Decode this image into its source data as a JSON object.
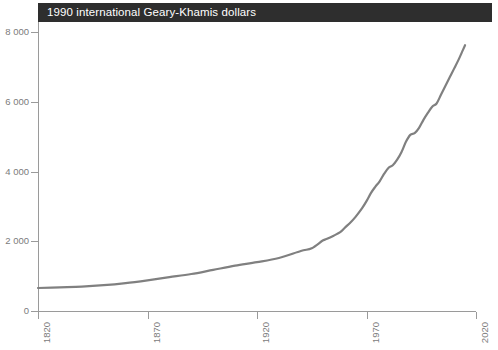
{
  "banner": {
    "title": "1990 international Geary-Khamis dollars"
  },
  "top_caption": {
    "text": ""
  },
  "colors": {
    "banner_background": "#2e2e2e",
    "banner_text": "#ffffff",
    "series_line": "#808080",
    "axis": "#9a9a9a",
    "tick_label": "#7b7b7b",
    "plot_background": "#ffffff"
  },
  "axes": {
    "y_ticks": [
      "0",
      "2 000",
      "4 000",
      "6 000",
      "8 000"
    ],
    "x_ticks": [
      "1820",
      "1870",
      "1920",
      "1970",
      "2020"
    ]
  },
  "chart_data": {
    "type": "line",
    "title": "1990 international Geary-Khamis dollars",
    "subtitle": "",
    "xlabel": "",
    "ylabel": "",
    "xlim": [
      1820,
      2020
    ],
    "ylim": [
      0,
      8000
    ],
    "xticks": [
      1820,
      1870,
      1920,
      1970,
      2020
    ],
    "yticks": [
      0,
      2000,
      4000,
      6000,
      8000
    ],
    "ytick_labels": [
      "0",
      "2 000",
      "4 000",
      "6 000",
      "8 000"
    ],
    "xtick_labels": [
      "1820",
      "1870",
      "1920",
      "1970",
      "2020"
    ],
    "grid": false,
    "legend": false,
    "legend_position": "none",
    "series": [
      {
        "name": "GDP per capita",
        "color": "#808080",
        "line_width": 2.2,
        "x": [
          1820,
          1830,
          1840,
          1850,
          1860,
          1870,
          1880,
          1890,
          1900,
          1910,
          1920,
          1930,
          1940,
          1945,
          1950,
          1952,
          1955,
          1958,
          1960,
          1963,
          1965,
          1968,
          1970,
          1972,
          1974,
          1976,
          1978,
          1980,
          1982,
          1984,
          1986,
          1988,
          1990,
          1992,
          1994,
          1996,
          1998,
          2000,
          2002,
          2004,
          2006,
          2008,
          2010,
          2012,
          2014,
          2015
        ],
        "y": [
          660,
          680,
          700,
          740,
          800,
          880,
          970,
          1060,
          1180,
          1300,
          1400,
          1520,
          1720,
          1800,
          2020,
          2070,
          2160,
          2260,
          2380,
          2560,
          2700,
          2950,
          3150,
          3380,
          3560,
          3720,
          3930,
          4100,
          4180,
          4340,
          4560,
          4850,
          5050,
          5100,
          5250,
          5480,
          5680,
          5860,
          5950,
          6200,
          6450,
          6700,
          6950,
          7200,
          7480,
          7620
        ]
      }
    ]
  }
}
